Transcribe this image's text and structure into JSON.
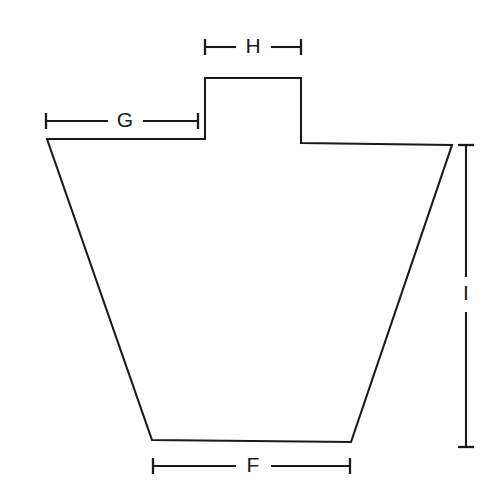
{
  "diagram": {
    "background_color": "#ffffff",
    "line_color": "#1a1a1a",
    "shape": {
      "name": "tapered-body-with-top-tab",
      "description": "Symmetric trapezoidal body with a raised rectangular tab centered on the top edge",
      "outline_points": "47,139 205,139 205,78 301,78 301,143 452,145 351,442 152,440 47,139",
      "vertices": [
        {
          "name": "top-left-shoulder",
          "x": 47,
          "y": 139
        },
        {
          "name": "tab-left-base",
          "x": 205,
          "y": 139
        },
        {
          "name": "tab-top-left",
          "x": 205,
          "y": 78
        },
        {
          "name": "tab-top-right",
          "x": 301,
          "y": 78
        },
        {
          "name": "tab-right-base",
          "x": 301,
          "y": 143
        },
        {
          "name": "top-right-shoulder",
          "x": 452,
          "y": 145
        },
        {
          "name": "bottom-right",
          "x": 351,
          "y": 442
        },
        {
          "name": "bottom-left",
          "x": 152,
          "y": 440
        }
      ]
    },
    "dimensions": [
      {
        "id": "H",
        "label": "H",
        "orientation": "horizontal",
        "measures": "tab width",
        "y": 47,
        "x_start": 205,
        "x_end": 301,
        "label_x": 253,
        "label_y": 47,
        "gap_left": 236,
        "gap_right": 271
      },
      {
        "id": "G",
        "label": "G",
        "orientation": "horizontal",
        "measures": "left shoulder width",
        "y": 121,
        "x_start": 46,
        "x_end": 198,
        "label_x": 125,
        "label_y": 121,
        "gap_left": 108,
        "gap_right": 143
      },
      {
        "id": "I",
        "label": "I",
        "orientation": "vertical",
        "measures": "overall body height",
        "x": 466,
        "y_start": 145,
        "y_end": 447,
        "label_x": 466,
        "label_y": 294,
        "gap_top": 277,
        "gap_bottom": 312
      },
      {
        "id": "F",
        "label": "F",
        "orientation": "horizontal",
        "measures": "bottom width",
        "y": 466,
        "x_start": 153,
        "x_end": 350,
        "label_x": 253,
        "label_y": 466,
        "gap_left": 236,
        "gap_right": 271
      }
    ],
    "tick_half_length": 8
  }
}
